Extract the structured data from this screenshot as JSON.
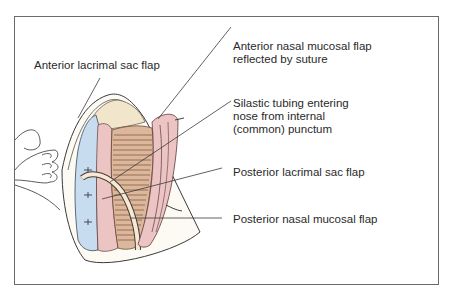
{
  "figure": {
    "type": "surgical-illustration",
    "colors": {
      "frame": "#6a6a6a",
      "lacrimal_sac_blue": "#c8dcef",
      "mucosa_pink": "#ecc4c4",
      "muscle_brown": "#8a5a3e",
      "bone_cream": "#f1e6cc",
      "tubing": "#f4e8d8",
      "line": "#3a3a3a"
    }
  },
  "labels": {
    "anterior_lacrimal_sac_flap": {
      "line1": "Anterior lacrimal sac flap"
    },
    "anterior_nasal_mucosal_flap": {
      "line1": "Anterior nasal mucosal flap",
      "line2": "reflected by suture"
    },
    "silastic_tubing": {
      "line1": "Silastic tubing entering",
      "line2": "nose from internal",
      "line3": "(common) punctum"
    },
    "posterior_lacrimal_sac_flap": {
      "line1": "Posterior lacrimal sac flap"
    },
    "posterior_nasal_mucosal_flap": {
      "line1": "Posterior nasal mucosal flap"
    }
  }
}
